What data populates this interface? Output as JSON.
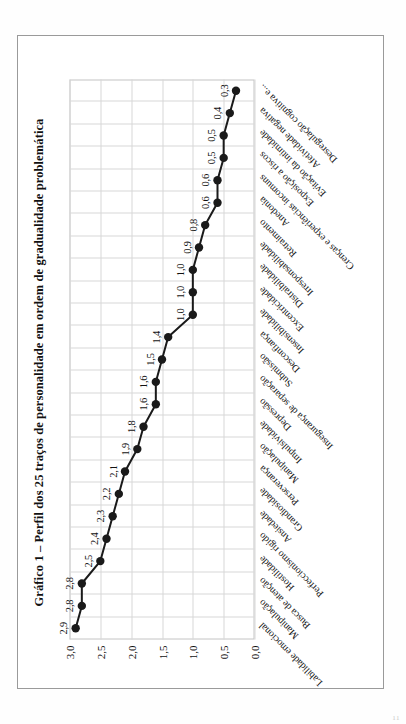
{
  "document": {
    "folio": "11"
  },
  "figure": {
    "title": "Gráfico 1 – Perfil dos 25 traços de personalidade em ordem de gradualidade problemática"
  },
  "chart_data": {
    "type": "line",
    "title": "Gráfico 1 – Perfil dos 25 traços de personalidade em ordem de gradualidade problemática",
    "xlabel": "",
    "ylabel": "",
    "ylim": [
      0.0,
      3.0
    ],
    "ytick_labels": [
      "3,0",
      "2,5",
      "2,0",
      "1,5",
      "1,0",
      "0,5",
      "0,0"
    ],
    "ytick_values": [
      3.0,
      2.5,
      2.0,
      1.5,
      1.0,
      0.5,
      0.0
    ],
    "grid": true,
    "legend": "none",
    "marker": "filled-circle",
    "decimal_separator": ",",
    "categories": [
      "Labilidade emocional",
      "Manipulação",
      "Busca de atenção",
      "Hostilidade",
      "Perfeccionismo rígido",
      "Ansiedade",
      "Grandiosidade",
      "Perseverança",
      "Manipulação",
      "Impulsividade",
      "Depressão",
      "Insegurança de separação",
      "Submissão",
      "Desconfiança",
      "Insensibilidade",
      "Excentricidade",
      "Distraibilidade",
      "Irresponsabilidade",
      "Retraimento",
      "Anedonia",
      "Crenças e experiências incomuns",
      "Exposição a riscos",
      "Evitação da intimidade",
      "Afetividade negativa",
      "Desregulação cognitiva e..."
    ],
    "values": [
      2.9,
      2.8,
      2.8,
      2.5,
      2.4,
      2.3,
      2.2,
      2.1,
      1.9,
      1.8,
      1.6,
      1.6,
      1.5,
      1.4,
      1.0,
      1.0,
      1.0,
      0.9,
      0.8,
      0.6,
      0.6,
      0.5,
      0.5,
      0.4,
      0.3
    ],
    "value_labels": [
      "2,9",
      "2,8",
      "2,8",
      "2,5",
      "2,4",
      "2,3",
      "2,2",
      "2,1",
      "1,9",
      "1,8",
      "1,6",
      "1,6",
      "1,5",
      "1,4",
      "1,0",
      "1,0",
      "1,0",
      "0,9",
      "0,8",
      "0,6",
      "0,6",
      "0,5",
      "0,5",
      "0,4",
      "0,3"
    ],
    "colors": {
      "line": "#1a1a1a",
      "marker": "#1a1a1a",
      "grid": "#d8d8d8",
      "axis": "#c4c4c4",
      "text": "#111111"
    }
  }
}
